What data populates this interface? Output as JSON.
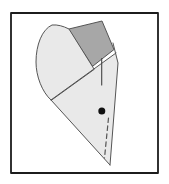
{
  "figure": {
    "canvas": {
      "width": 169,
      "height": 184,
      "background": "#ffffff"
    },
    "colors": {
      "paper_light": "#e9e9e9",
      "paper_dark": "#a7a7a7",
      "outline": "#555555",
      "frame": "#1c1c1c",
      "dot": "#111111"
    },
    "shapes": [
      {
        "name": "figure-border",
        "type": "rect",
        "x": 11,
        "y": 13,
        "width": 147,
        "height": 160,
        "fill": "#ffffff",
        "stroke": "#1c1c1c",
        "stroke_width": 1.8
      },
      {
        "name": "back-flap-dark",
        "type": "polygon",
        "points": "69,29 102,21 114,49.5 93,66",
        "fill": "#a7a7a7",
        "stroke": "#555555",
        "stroke_width": 1
      },
      {
        "name": "main-triangle-layer",
        "type": "path",
        "d": "M51,100 L116,53 L118,63 L110,165 Z",
        "fill": "#e9e9e9",
        "stroke": "none",
        "stroke_width": 0
      },
      {
        "name": "curved-petal-flap",
        "type": "path",
        "d": "M51,100 C42,92 36,76 36,62 C36,45 42,29.5 52,25 C57.5,24.5 63,26 69,29 L94,69 Z",
        "fill": "#e9e9e9",
        "stroke": "#555555",
        "stroke_width": 1
      },
      {
        "name": "hypotenuse-crease-edge",
        "type": "path",
        "d": "M51,100 L116,53",
        "fill": "none",
        "stroke": "#555555",
        "stroke_width": 1
      },
      {
        "name": "right-edge",
        "type": "path",
        "d": "M113,43 L118,63 L110,165",
        "fill": "none",
        "stroke": "#555555",
        "stroke_width": 1
      },
      {
        "name": "bottom-left-edge",
        "type": "path",
        "d": "M110,165 L51,100",
        "fill": "none",
        "stroke": "#555555",
        "stroke_width": 1
      },
      {
        "name": "vertical-crease-line",
        "type": "path",
        "d": "M101.7,58.5 L101.7,85",
        "fill": "none",
        "stroke": "#444444",
        "stroke_width": 1.1
      },
      {
        "name": "eye-dot",
        "type": "circle",
        "cx": 101.8,
        "cy": 111,
        "r": 3.5,
        "fill": "#111111",
        "stroke": "none",
        "stroke_width": 0
      },
      {
        "name": "valley-fold-dashed-line",
        "type": "path",
        "d": "M108.5,118 L104.5,158",
        "fill": "none",
        "stroke": "#555555",
        "stroke_width": 1.2,
        "dash": "4.5 3.5"
      }
    ]
  }
}
